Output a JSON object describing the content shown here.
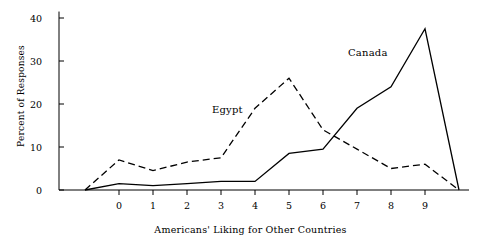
{
  "chart_data": {
    "type": "line",
    "title": "",
    "xlabel": "Americans' Liking for Other Countries",
    "ylabel": "Percent of Responses",
    "x": [
      0,
      1,
      2,
      3,
      4,
      5,
      6,
      7,
      8,
      9
    ],
    "xticklabels": [
      "0",
      "1",
      "2",
      "3",
      "4",
      "5",
      "6",
      "7",
      "8",
      "9"
    ],
    "yticks": [
      0,
      10,
      20,
      30,
      40
    ],
    "yticklabels": [
      "0",
      "10",
      "20",
      "30",
      "40"
    ],
    "ylim": [
      0,
      42
    ],
    "xlim": [
      -1.3,
      10.3
    ],
    "grid": false,
    "legend_position": "inline-annotations",
    "series": [
      {
        "name": "Egypt",
        "style": "dashed",
        "color": "#000000",
        "x": [
          -1,
          0,
          1,
          2,
          3,
          4,
          5,
          6,
          7,
          8,
          9,
          10
        ],
        "values": [
          0,
          7,
          4.5,
          6.5,
          7.5,
          19,
          26,
          14,
          9.5,
          5,
          6,
          0
        ]
      },
      {
        "name": "Canada",
        "style": "solid",
        "color": "#000000",
        "x": [
          -1,
          0,
          1,
          2,
          3,
          4,
          5,
          6,
          7,
          8,
          9,
          10
        ],
        "values": [
          0,
          1.5,
          1,
          1.5,
          2,
          2,
          8.5,
          9.5,
          19,
          24,
          37.5,
          0
        ]
      }
    ],
    "annotations": [
      {
        "text": "Egypt",
        "x": 3.55,
        "y": 21.5
      },
      {
        "text": "Canada",
        "x": 6.95,
        "y": 33.5
      }
    ]
  }
}
